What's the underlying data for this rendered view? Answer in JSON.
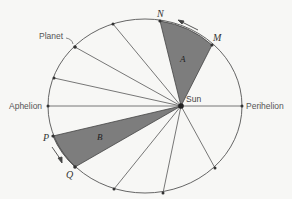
{
  "diagram": {
    "title": "",
    "labels": {
      "planet": "Planet",
      "aphelion": "Aphelion",
      "perihelion": "Perihelion",
      "sun": "Sun",
      "n": "N",
      "m": "M",
      "p": "P",
      "q": "Q",
      "area_a": "A",
      "area_b": "B"
    },
    "colors": {
      "background": "#f7f7f5",
      "line": "#555555",
      "shade": "#808080",
      "point": "#333333"
    },
    "orbit": {
      "cx": 145,
      "cy": 106,
      "rx": 97,
      "ry": 87
    },
    "sun": {
      "x": 181,
      "y": 106
    },
    "points": [
      {
        "name": "N",
        "x": 160,
        "y": 21
      },
      {
        "name": "M",
        "x": 212,
        "y": 45
      },
      {
        "name": "top",
        "x": 113,
        "y": 24
      },
      {
        "name": "Planet",
        "x": 75,
        "y": 47
      },
      {
        "name": "upper-left",
        "x": 54,
        "y": 78
      },
      {
        "name": "Aphelion",
        "x": 48,
        "y": 106
      },
      {
        "name": "P",
        "x": 53,
        "y": 136
      },
      {
        "name": "Q",
        "x": 75,
        "y": 167
      },
      {
        "name": "bottom-1",
        "x": 114,
        "y": 189
      },
      {
        "name": "bottom-2",
        "x": 163,
        "y": 193
      },
      {
        "name": "bottom-3",
        "x": 215,
        "y": 168
      },
      {
        "name": "Perihelion",
        "x": 242,
        "y": 106
      }
    ],
    "shaded_sectors": [
      {
        "label": "A",
        "from": "M",
        "to": "N"
      },
      {
        "label": "B",
        "from": "P",
        "to": "Q"
      }
    ]
  }
}
